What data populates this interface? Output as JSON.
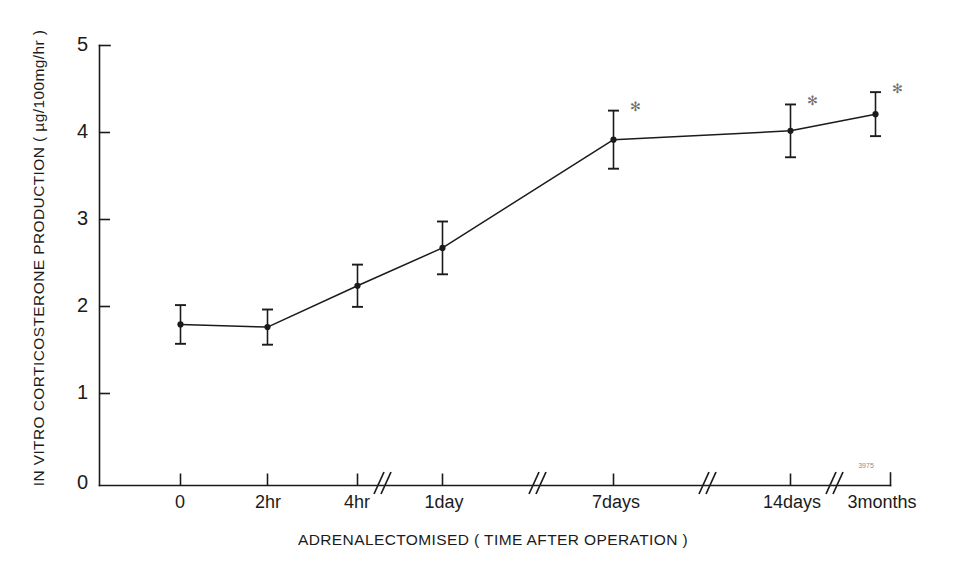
{
  "figure": {
    "background_color": "#ffffff",
    "ink_color": "#1b1b1b",
    "marker_color": "#6e6e6e"
  },
  "chart_data": {
    "type": "line",
    "title": "",
    "xlabel": "ADRENALECTOMISED ( TIME AFTER OPERATION )",
    "ylabel": "IN VITRO CORTICOSTERONE PRODUCTION ( µg/100mg/hr )",
    "categories": [
      "0",
      "2hr",
      "4hr",
      "1day",
      "7days",
      "14days",
      "3months"
    ],
    "values": [
      1.83,
      1.8,
      2.27,
      2.7,
      3.93,
      4.03,
      4.22
    ],
    "errors": [
      0.22,
      0.2,
      0.24,
      0.3,
      0.33,
      0.3,
      0.25
    ],
    "significance": [
      "",
      "",
      "",
      "",
      "*",
      "*",
      "*"
    ],
    "ylim": [
      0,
      5
    ],
    "yticks": [
      0,
      1,
      2,
      3,
      4,
      5
    ],
    "ytick_labels": [
      "0",
      "1",
      "2",
      "3",
      "4",
      "5"
    ],
    "grid": false,
    "legend": "none",
    "axis_breaks_after": [
      "4hr",
      "1day",
      "7days",
      "14days"
    ],
    "break_symbol": "//",
    "scan_annotation": "3975"
  },
  "axis": {
    "y_tick_labels": [
      "5",
      "4",
      "3",
      "2",
      "1",
      "0"
    ],
    "x_tick_labels": [
      "0",
      "2hr",
      "4hr",
      "1day",
      "7days",
      "14days",
      "3months"
    ],
    "x_title": "ADRENALECTOMISED ( TIME AFTER OPERATION )",
    "y_title": "IN VITRO CORTICOSTERONE PRODUCTION ( µg/100mg/hr )"
  },
  "annotations": {
    "star_symbol": "✻",
    "scan_mark": "3975"
  }
}
